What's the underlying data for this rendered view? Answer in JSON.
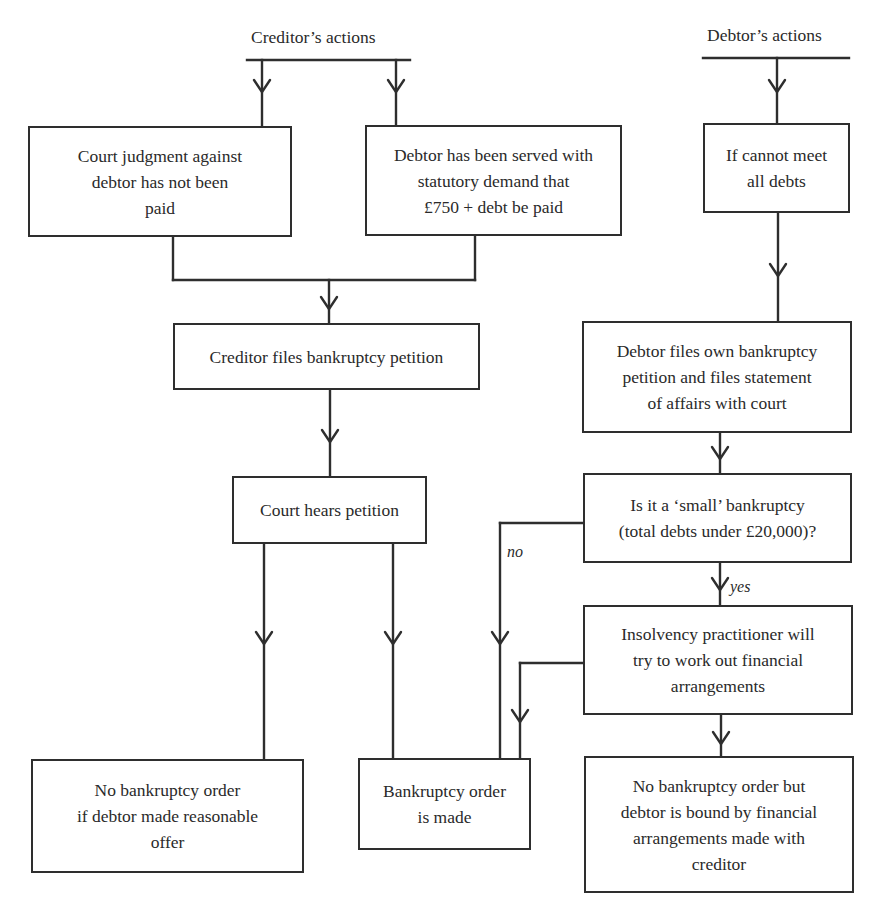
{
  "diagram": {
    "title_clipped": "",
    "headings": {
      "creditor": "Creditor’s actions",
      "debtor": "Debtor’s actions"
    },
    "nodes": {
      "court_judgment": "Court judgment against\ndebtor has not been\npaid",
      "statutory_demand": "Debtor has been served with\nstatutory demand that\n£750 + debt be paid",
      "cannot_meet_debts": "If cannot meet\nall debts",
      "creditor_files": "Creditor files bankruptcy petition",
      "debtor_files": "Debtor files own bankruptcy\npetition and files statement\nof affairs with court",
      "court_hears": "Court hears petition",
      "small_bankruptcy": "Is it a ‘small’ bankruptcy\n(total debts under £20,000)?",
      "insolvency_practitioner": "Insolvency practitioner will\ntry to work out financial\narrangements",
      "no_order_reasonable_offer": "No bankruptcy order\nif debtor made reasonable\noffer",
      "order_made": "Bankruptcy order\nis made",
      "no_order_bound": "No bankruptcy order but\ndebtor is bound by financial\narrangements made with\ncreditor"
    },
    "edge_labels": {
      "no": "no",
      "yes": "yes"
    },
    "edges": [
      {
        "from": "creditor_heading",
        "to": "court_judgment"
      },
      {
        "from": "creditor_heading",
        "to": "statutory_demand"
      },
      {
        "from": "debtor_heading",
        "to": "cannot_meet_debts"
      },
      {
        "from": "court_judgment",
        "to": "creditor_files"
      },
      {
        "from": "statutory_demand",
        "to": "creditor_files"
      },
      {
        "from": "cannot_meet_debts",
        "to": "debtor_files"
      },
      {
        "from": "creditor_files",
        "to": "court_hears"
      },
      {
        "from": "debtor_files",
        "to": "small_bankruptcy"
      },
      {
        "from": "court_hears",
        "to": "no_order_reasonable_offer"
      },
      {
        "from": "court_hears",
        "to": "order_made"
      },
      {
        "from": "small_bankruptcy",
        "to": "order_made",
        "label": "no"
      },
      {
        "from": "small_bankruptcy",
        "to": "insolvency_practitioner",
        "label": "yes"
      },
      {
        "from": "insolvency_practitioner",
        "to": "order_made"
      },
      {
        "from": "insolvency_practitioner",
        "to": "no_order_bound"
      }
    ],
    "colors": {
      "line": "#2e2e2e",
      "text": "#2a2a2a",
      "background": "#ffffff"
    }
  }
}
